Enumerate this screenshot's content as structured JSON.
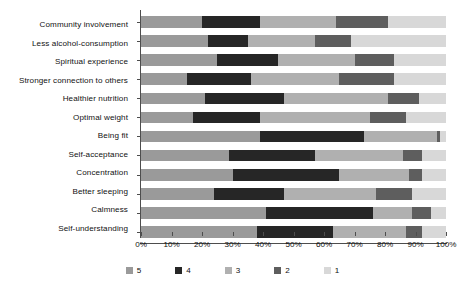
{
  "chart_data": {
    "type": "bar",
    "orientation": "horizontal",
    "stacked": true,
    "normalized": true,
    "title": "",
    "xlabel": "",
    "ylabel": "",
    "xlim": [
      0,
      100
    ],
    "grid": false,
    "legend_position": "bottom",
    "x_tick_labels": [
      "0%",
      "10%",
      "20%",
      "30%",
      "40%",
      "50%",
      "60%",
      "70%",
      "80%",
      "90%",
      "100%"
    ],
    "x_tick_values": [
      0,
      10,
      20,
      30,
      40,
      50,
      60,
      70,
      80,
      90,
      100
    ],
    "categories": [
      "Community involvement",
      "Less alcohol-consumption",
      "Spiritual experience",
      "Stronger connection to others",
      "Healthier nutrition",
      "Optimal weight",
      "Being fit",
      "Self-acceptance",
      "Concentration",
      "Better sleeping",
      "Calmness",
      "Self-understanding"
    ],
    "series": [
      {
        "name": "5",
        "color": "#9a9a9a",
        "values": [
          20,
          22,
          25,
          15,
          21,
          17,
          39,
          29,
          30,
          24,
          41,
          38
        ]
      },
      {
        "name": "4",
        "color": "#262626",
        "values": [
          19,
          13,
          20,
          21,
          26,
          22,
          34,
          28,
          35,
          23,
          35,
          25
        ]
      },
      {
        "name": "3",
        "color": "#b0b0b0",
        "values": [
          25,
          22,
          25,
          29,
          34,
          36,
          24,
          29,
          23,
          30,
          13,
          24
        ]
      },
      {
        "name": "2",
        "color": "#5e5e5e",
        "values": [
          17,
          12,
          13,
          18,
          10,
          12,
          1,
          6,
          4,
          12,
          6,
          5
        ]
      },
      {
        "name": "1",
        "color": "#d8d8d8",
        "values": [
          19,
          31,
          17,
          17,
          9,
          13,
          2,
          8,
          8,
          11,
          5,
          8
        ]
      }
    ]
  },
  "legend": {
    "items": [
      {
        "label": "5",
        "color": "#9a9a9a"
      },
      {
        "label": "4",
        "color": "#262626"
      },
      {
        "label": "3",
        "color": "#b0b0b0"
      },
      {
        "label": "2",
        "color": "#5e5e5e"
      },
      {
        "label": "1",
        "color": "#d8d8d8"
      }
    ]
  },
  "axis": {
    "line_color": "#4d4d4d"
  }
}
